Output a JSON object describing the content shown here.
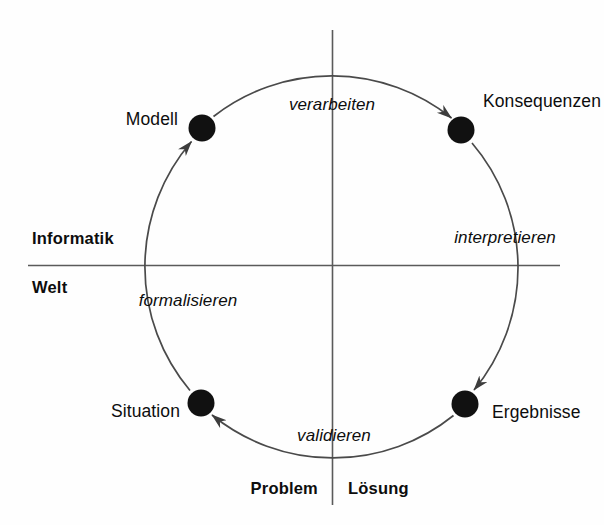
{
  "diagram": {
    "type": "cycle-diagram",
    "colors": {
      "stroke": "#3d3d3d",
      "node_fill": "#111111",
      "text": "#0d0d0d",
      "background": "#fefefe"
    },
    "geometry": {
      "center_x": 332,
      "center_y": 265,
      "radius": 192,
      "node_radius": 13
    },
    "nodes": [
      {
        "id": "modell",
        "label": "Modell",
        "x": 202,
        "y": 128,
        "label_side": "left",
        "label_x": 178,
        "label_y": 120
      },
      {
        "id": "konsequenzen",
        "label": "Konsequenzen",
        "x": 461,
        "y": 130,
        "label_side": "right",
        "label_x": 483,
        "label_y": 102
      },
      {
        "id": "ergebnisse",
        "label": "Ergebnisse",
        "x": 465,
        "y": 404,
        "label_side": "right",
        "label_x": 492,
        "label_y": 413
      },
      {
        "id": "situation",
        "label": "Situation",
        "x": 201,
        "y": 403,
        "label_side": "left",
        "label_x": 180,
        "label_y": 412
      }
    ],
    "edges": [
      {
        "id": "verarbeiten",
        "label": "verarbeiten",
        "from": "modell",
        "to": "konsequenzen",
        "label_x": 332,
        "label_y": 104
      },
      {
        "id": "interpretieren",
        "label": "interpretieren",
        "from": "konsequenzen",
        "to": "ergebnisse",
        "label_x": 505,
        "label_y": 237
      },
      {
        "id": "validieren",
        "label": "validieren",
        "from": "ergebnisse",
        "to": "situation",
        "label_x": 334,
        "label_y": 435
      },
      {
        "id": "formalisieren",
        "label": "formalisieren",
        "from": "situation",
        "to": "modell",
        "label_x": 188,
        "label_y": 300
      }
    ],
    "axes": {
      "horizontal": {
        "x1": 28,
        "x2": 560,
        "y": 265
      },
      "vertical": {
        "x": 332,
        "y1": 30,
        "y2": 505
      },
      "labels": [
        {
          "id": "informatik",
          "label": "Informatik",
          "x": 32,
          "y": 238,
          "align": "left"
        },
        {
          "id": "welt",
          "label": "Welt",
          "x": 32,
          "y": 287,
          "align": "left"
        },
        {
          "id": "problem",
          "label": "Problem",
          "x": 318,
          "y": 488,
          "align": "right"
        },
        {
          "id": "loesung",
          "label": "Lösung",
          "x": 348,
          "y": 488,
          "align": "left"
        }
      ]
    }
  }
}
